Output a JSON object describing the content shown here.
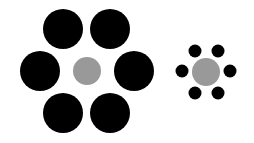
{
  "colors": {
    "background": "#ffffff",
    "inducer": "#000000",
    "target": "#999999"
  },
  "groups": [
    {
      "name": "large-surround",
      "inducer_count": 6,
      "inducer_size": "large"
    },
    {
      "name": "small-surround",
      "inducer_count": 6,
      "inducer_size": "small"
    }
  ]
}
